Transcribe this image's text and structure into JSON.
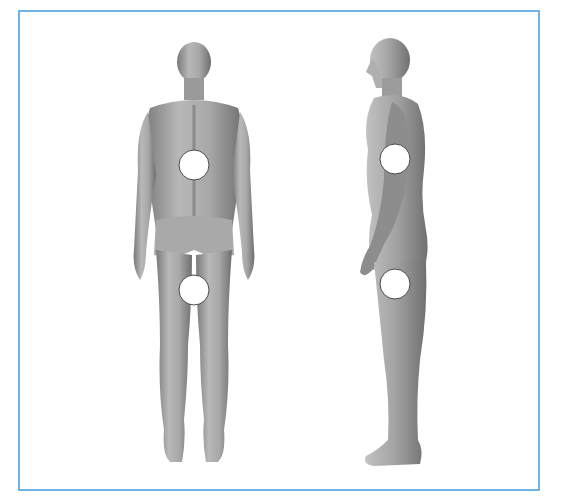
{
  "figure": {
    "frame_color": "#6fb3e6",
    "background_color": "#ffffff",
    "skin_tone_light": "#c9c9c9",
    "skin_tone_mid": "#9e9e9e",
    "skin_tone_dark": "#6f6f6f",
    "marker_fill": "#ffffff",
    "marker_stroke": "#4a4a4a"
  },
  "views": [
    {
      "id": "back",
      "label": "back view",
      "markers": [
        {
          "name": "lower-back-marker",
          "cx": 194,
          "cy": 165,
          "r": 15
        },
        {
          "name": "upper-thigh-marker",
          "cx": 194,
          "cy": 290,
          "r": 15
        }
      ]
    },
    {
      "id": "side",
      "label": "side view",
      "markers": [
        {
          "name": "flank-marker",
          "cx": 395,
          "cy": 159,
          "r": 15
        },
        {
          "name": "thigh-marker",
          "cx": 395,
          "cy": 284,
          "r": 15
        }
      ]
    }
  ]
}
